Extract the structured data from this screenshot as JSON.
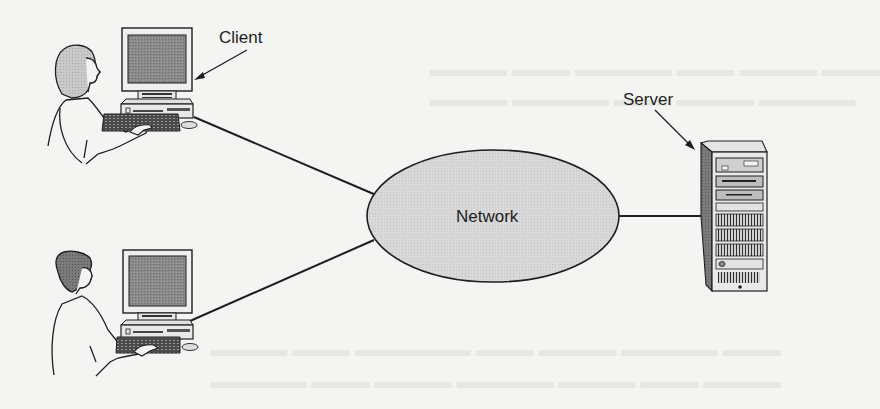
{
  "figure": {
    "type": "client-server network diagram",
    "background_color": "#f4f4f2",
    "ink_color": "#1e1e1e",
    "labels": {
      "client": "Client",
      "server": "Server",
      "network": "Network"
    },
    "nodes": [
      {
        "id": "client-top",
        "kind": "workstation",
        "user": "woman at desktop computer",
        "callout": "Client"
      },
      {
        "id": "client-bottom",
        "kind": "workstation",
        "user": "man at desktop computer"
      },
      {
        "id": "network",
        "kind": "ellipse",
        "fill": "#d6d6d6",
        "label": "Network"
      },
      {
        "id": "server",
        "kind": "tower server",
        "callout": "Server"
      }
    ],
    "links": [
      {
        "from": "client-top",
        "to": "network"
      },
      {
        "from": "client-bottom",
        "to": "network"
      },
      {
        "from": "network",
        "to": "server"
      }
    ]
  }
}
